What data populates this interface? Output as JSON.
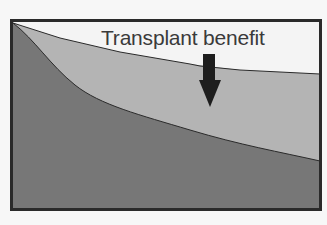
{
  "diagram": {
    "annotation": "Transplant benefit",
    "colors": {
      "background": "#f7f7f7",
      "upper_region": "#f4f4f4",
      "benefit_region": "#b4b4b4",
      "lower_region": "#777777",
      "frame": "#2a2a2a",
      "arrow": "#1e1e1e"
    },
    "regions": [
      {
        "name": "with-transplant-curve",
        "shape": "shallow-decline"
      },
      {
        "name": "without-transplant-curve",
        "shape": "steep-decline"
      }
    ]
  }
}
